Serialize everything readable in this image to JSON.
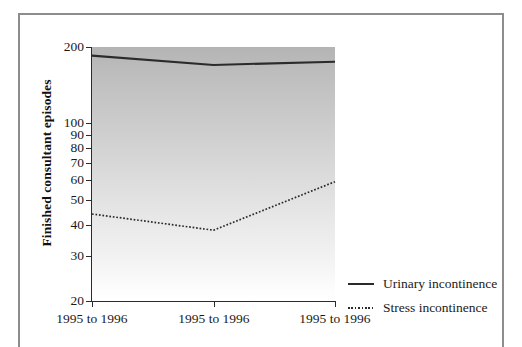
{
  "chart_data": {
    "type": "line",
    "title": "",
    "subtitle": "",
    "xlabel": "",
    "ylabel": "Finished consultant episodes",
    "yscale": "log",
    "ylim": [
      20,
      200
    ],
    "ytick_labels": [
      "200",
      "100",
      "90",
      "80",
      "70",
      "60",
      "50",
      "40",
      "30",
      "20"
    ],
    "ytick_values": [
      200,
      100,
      90,
      80,
      70,
      60,
      50,
      40,
      30,
      20
    ],
    "xtick_labels": [
      "1995 to 1996",
      "1995 to 1996",
      "1995 to 1996"
    ],
    "categories": [
      "1995 to 1996",
      "1995 to 1996",
      "1995 to 1996"
    ],
    "grid": false,
    "legend_position": "bottom-right",
    "series": [
      {
        "name": "Urinary incontinence",
        "style": "solid",
        "color": "#2b2b2b",
        "values": [
          185,
          170,
          175
        ]
      },
      {
        "name": "Stress incontinence",
        "style": "dotted",
        "color": "#2b2b2b",
        "values": [
          44,
          38,
          59
        ]
      }
    ],
    "area_fill": {
      "type": "vertical-gradient",
      "top_color": "#b4b4b4",
      "bottom_color": "#ffffff"
    }
  },
  "axis": {
    "y_title": "Finished consultant episodes",
    "y_ticks": [
      {
        "label": "200",
        "value": 200
      },
      {
        "label": "100",
        "value": 100
      },
      {
        "label": "90",
        "value": 90
      },
      {
        "label": "80",
        "value": 80
      },
      {
        "label": "70",
        "value": 70
      },
      {
        "label": "60",
        "value": 60
      },
      {
        "label": "50",
        "value": 50
      },
      {
        "label": "40",
        "value": 40
      },
      {
        "label": "30",
        "value": 30
      },
      {
        "label": "20",
        "value": 20
      }
    ],
    "x_ticks": [
      {
        "label": "1995 to 1996"
      },
      {
        "label": "1995 to 1996"
      },
      {
        "label": "1995 to 1996"
      }
    ]
  },
  "legend": {
    "items": [
      {
        "label": "Urinary incontinence",
        "style": "solid"
      },
      {
        "label": "Stress incontinence",
        "style": "dotted"
      }
    ]
  }
}
